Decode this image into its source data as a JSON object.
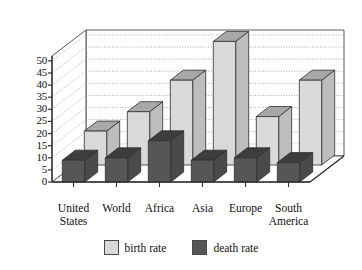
{
  "chart_data": {
    "type": "bar",
    "title": "",
    "subtitle": "",
    "xlabel": "",
    "ylabel": "",
    "ylim": [
      0,
      52
    ],
    "yticks": [
      0,
      5,
      10,
      15,
      20,
      25,
      30,
      35,
      40,
      45,
      50
    ],
    "grid": true,
    "three_d": true,
    "legend_position": "bottom-center",
    "categories": [
      "United States",
      "World",
      "Africa",
      "Asia",
      "Europe",
      "South America"
    ],
    "category_lines": [
      [
        "United",
        "States"
      ],
      [
        "World"
      ],
      [
        "Africa"
      ],
      [
        "Asia"
      ],
      [
        "Europe"
      ],
      [
        "South",
        "America"
      ]
    ],
    "series": [
      {
        "name": "birth rate",
        "color": "#d9d9d9",
        "values": [
          14,
          22,
          35,
          51,
          20,
          35
        ]
      },
      {
        "name": "death rate",
        "color": "#565656",
        "values": [
          9,
          10,
          17,
          9,
          10,
          8
        ]
      }
    ],
    "colors": {
      "birth_rate_face": "#d9d9d9",
      "birth_rate_top": "#a8a8a8",
      "birth_rate_side": "#bdbdbd",
      "death_rate_face": "#565656",
      "death_rate_top": "#3d3d3d",
      "death_rate_side": "#4a4a4a",
      "axis": "#333333",
      "grid": "#8a8a8a",
      "wall": "#ffffff",
      "floor": "#ffffff",
      "text": "#111111"
    }
  },
  "legend": {
    "items": [
      {
        "label": "birth rate",
        "swatch": "light-gray-swatch"
      },
      {
        "label": "death rate",
        "swatch": "dark-gray-swatch"
      }
    ]
  },
  "axis": {
    "y_tick_labels": [
      "50",
      "45",
      "40",
      "35",
      "30",
      "25",
      "20",
      "15",
      "10",
      "5",
      "0"
    ]
  }
}
